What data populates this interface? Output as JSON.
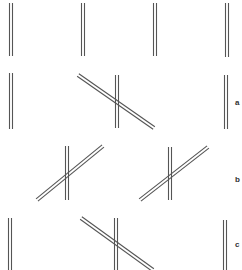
{
  "figure": {
    "stroke_color": "#555555",
    "background": "#ffffff",
    "row_labels": [
      "a",
      "b",
      "c"
    ],
    "top_row": {
      "verticals": [
        {
          "x": 11,
          "y1": 3,
          "y2": 56
        },
        {
          "x": 83,
          "y1": 3,
          "y2": 56
        },
        {
          "x": 155,
          "y1": 3,
          "y2": 56
        },
        {
          "x": 227,
          "y1": 3,
          "y2": 57
        }
      ]
    },
    "row_a": {
      "label": "a",
      "verticals": [
        {
          "x": 11,
          "y1": 73,
          "y2": 129
        },
        {
          "x": 117,
          "y1": 75,
          "y2": 128
        },
        {
          "x": 226,
          "y1": 75,
          "y2": 129
        }
      ],
      "diagonals": [
        {
          "x1": 78,
          "y1": 75,
          "x2": 154,
          "y2": 128
        }
      ]
    },
    "row_b": {
      "label": "b",
      "verticals": [
        {
          "x": 67,
          "y1": 146,
          "y2": 200
        },
        {
          "x": 170,
          "y1": 147,
          "y2": 200
        }
      ],
      "diagonals": [
        {
          "x1": 37,
          "y1": 200,
          "x2": 103,
          "y2": 146
        },
        {
          "x1": 140,
          "y1": 200,
          "x2": 208,
          "y2": 147
        }
      ]
    },
    "row_c": {
      "label": "c",
      "verticals": [
        {
          "x": 10,
          "y1": 218,
          "y2": 270
        },
        {
          "x": 116,
          "y1": 218,
          "y2": 270
        },
        {
          "x": 225,
          "y1": 220,
          "y2": 270
        }
      ],
      "diagonals": [
        {
          "x1": 81,
          "y1": 218,
          "x2": 153,
          "y2": 270
        }
      ]
    }
  }
}
